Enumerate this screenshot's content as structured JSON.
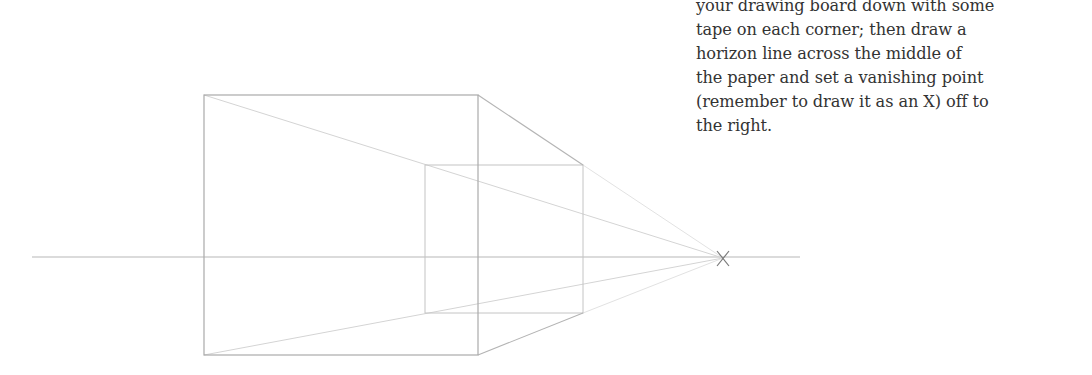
{
  "caption": {
    "lines": [
      "your drawing board down with some",
      "tape on each corner; then draw a",
      "horizon line across the middle of",
      "the paper and set a vanishing point",
      "(remember to draw it as an X) off to",
      "the right."
    ]
  },
  "drawing": {
    "type": "one-point perspective box",
    "horizon": {
      "x1": 32,
      "x2": 800,
      "y": 257
    },
    "vanishing_point": {
      "x": 723,
      "y": 258,
      "mark": "X"
    },
    "front_face": {
      "x1": 204,
      "y1": 95,
      "x2": 478,
      "y2": 355
    },
    "back_face": {
      "x1": 425,
      "y1": 165,
      "x2": 583,
      "y2": 313
    },
    "colors": {
      "line": "#b4b4b4",
      "construction": "#d2d2d2",
      "vp_mark": "#777777"
    }
  }
}
